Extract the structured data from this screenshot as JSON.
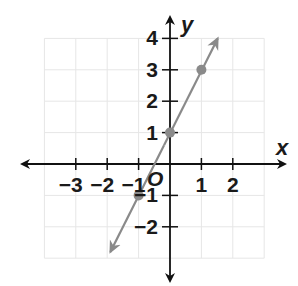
{
  "chart_data": {
    "type": "line",
    "title": "",
    "xlabel": "x",
    "ylabel": "y",
    "origin_label": "O",
    "xlim": [
      -4,
      3
    ],
    "ylim": [
      -3,
      4
    ],
    "grid": true,
    "x_ticks": [
      -3,
      -2,
      -1,
      1,
      2
    ],
    "y_ticks": [
      4,
      3,
      2,
      1,
      -1,
      -2
    ],
    "x_tick_labels": [
      "−3",
      "−2",
      "−1",
      "1",
      "2"
    ],
    "y_tick_labels": [
      "4",
      "3",
      "2",
      "1",
      "−1",
      "−2"
    ],
    "series": [
      {
        "name": "y = 2x + 1",
        "equation": "y = 2x + 1",
        "slope": 2,
        "intercept": 1,
        "points": [
          {
            "x": -1,
            "y": -1
          },
          {
            "x": 0,
            "y": 1
          },
          {
            "x": 1,
            "y": 3
          }
        ],
        "line_extent": {
          "x_start": -1.9,
          "y_start": -2.8,
          "x_end": 1.52,
          "y_end": 4.0
        },
        "arrows": "both"
      }
    ],
    "colors": {
      "axis": "#111111",
      "line": "#8a8a8a",
      "points": "#8a8a8a",
      "grid": "#e6e6e6",
      "labels": "#1a1a1a"
    }
  }
}
